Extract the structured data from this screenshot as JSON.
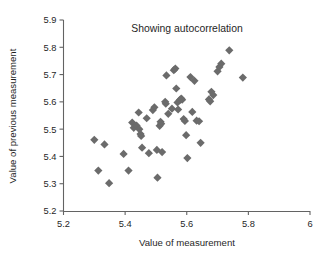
{
  "chart_data": {
    "type": "scatter",
    "title": "Showing autocorrelation",
    "xlabel": "Value of measurement",
    "ylabel": "Value of previous measurement",
    "xlim": [
      5.2,
      6.0
    ],
    "ylim": [
      5.2,
      5.9
    ],
    "xticks": [
      5.2,
      5.4,
      5.6,
      5.8,
      6
    ],
    "xticklabels": [
      "5.2",
      "5.4",
      "5.6",
      "5.8",
      "6"
    ],
    "yticks": [
      5.2,
      5.3,
      5.4,
      5.5,
      5.6,
      5.7,
      5.8,
      5.9
    ],
    "yticklabels": [
      "5.2",
      "5.3",
      "5.4",
      "5.5",
      "5.6",
      "5.7",
      "5.8",
      "5.9"
    ],
    "grid": false,
    "legend": null,
    "marker": "diamond",
    "marker_color": "#6b6b6b",
    "marker_size": 7,
    "series": [
      {
        "name": "measurements",
        "points": [
          [
            5.3,
            5.461
          ],
          [
            5.313,
            5.348
          ],
          [
            5.333,
            5.444
          ],
          [
            5.348,
            5.302
          ],
          [
            5.395,
            5.409
          ],
          [
            5.411,
            5.348
          ],
          [
            5.423,
            5.524
          ],
          [
            5.428,
            5.505
          ],
          [
            5.437,
            5.513
          ],
          [
            5.444,
            5.561
          ],
          [
            5.446,
            5.5
          ],
          [
            5.45,
            5.482
          ],
          [
            5.452,
            5.475
          ],
          [
            5.455,
            5.432
          ],
          [
            5.47,
            5.54
          ],
          [
            5.477,
            5.412
          ],
          [
            5.49,
            5.57
          ],
          [
            5.495,
            5.58
          ],
          [
            5.503,
            5.424
          ],
          [
            5.505,
            5.322
          ],
          [
            5.512,
            5.512
          ],
          [
            5.515,
            5.527
          ],
          [
            5.517,
            5.52
          ],
          [
            5.52,
            5.416
          ],
          [
            5.53,
            5.6
          ],
          [
            5.532,
            5.593
          ],
          [
            5.534,
            5.697
          ],
          [
            5.54,
            5.556
          ],
          [
            5.552,
            5.575
          ],
          [
            5.558,
            5.716
          ],
          [
            5.563,
            5.722
          ],
          [
            5.566,
            5.649
          ],
          [
            5.57,
            5.598
          ],
          [
            5.572,
            5.572
          ],
          [
            5.578,
            5.607
          ],
          [
            5.582,
            5.612
          ],
          [
            5.585,
            5.608
          ],
          [
            5.59,
            5.537
          ],
          [
            5.594,
            5.53
          ],
          [
            5.598,
            5.478
          ],
          [
            5.602,
            5.394
          ],
          [
            5.612,
            5.691
          ],
          [
            5.618,
            5.563
          ],
          [
            5.625,
            5.677
          ],
          [
            5.632,
            5.531
          ],
          [
            5.64,
            5.529
          ],
          [
            5.645,
            5.45
          ],
          [
            5.672,
            5.609
          ],
          [
            5.676,
            5.602
          ],
          [
            5.68,
            5.637
          ],
          [
            5.686,
            5.625
          ],
          [
            5.7,
            5.712
          ],
          [
            5.706,
            5.728
          ],
          [
            5.712,
            5.74
          ],
          [
            5.738,
            5.789
          ],
          [
            5.782,
            5.689
          ]
        ]
      }
    ]
  }
}
